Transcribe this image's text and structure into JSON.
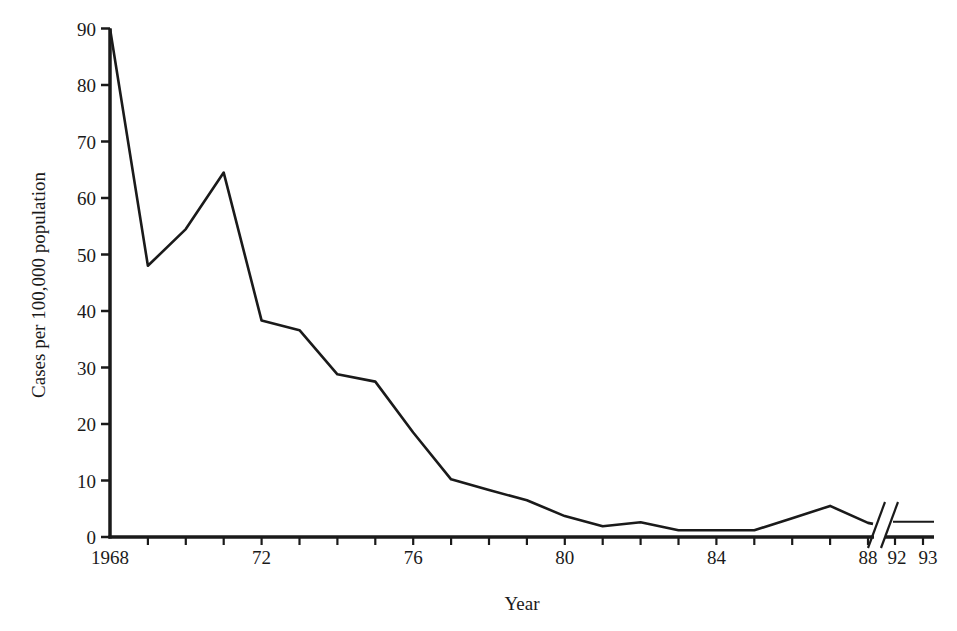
{
  "chart_data": {
    "type": "line",
    "title": "",
    "xlabel": "Year",
    "ylabel": "Cases per 100,000 population",
    "ylim": [
      0,
      90
    ],
    "yticks": [
      0,
      10,
      20,
      30,
      40,
      50,
      60,
      70,
      80,
      90
    ],
    "xtick_labels": [
      {
        "year": 1968,
        "label": "1968"
      },
      {
        "year": 1972,
        "label": "72"
      },
      {
        "year": 1976,
        "label": "76"
      },
      {
        "year": 1980,
        "label": "80"
      },
      {
        "year": 1984,
        "label": "84"
      },
      {
        "year": 1988,
        "label": "88"
      },
      {
        "year": 1992,
        "label": "92"
      },
      {
        "year": 1993,
        "label": "93"
      }
    ],
    "axis_break": {
      "between": [
        1988,
        1992
      ],
      "style": "double-slash"
    },
    "grid": false,
    "legend": null,
    "series": [
      {
        "name": "Incidence",
        "x": [
          1968,
          1969,
          1970,
          1971,
          1972,
          1973,
          1974,
          1975,
          1976,
          1977,
          1978,
          1979,
          1980,
          1981,
          1982,
          1983,
          1984,
          1985,
          1986,
          1987,
          1988,
          1992,
          1993
        ],
        "values": [
          90,
          48,
          54.5,
          64.5,
          38.3,
          36.6,
          28.8,
          27.5,
          18.5,
          10.2,
          8.3,
          6.5,
          3.7,
          1.9,
          2.6,
          1.2,
          1.2,
          1.2,
          3.3,
          5.5,
          2.5,
          2.7,
          2.7
        ]
      }
    ]
  },
  "caption": {
    "visible_text": ""
  }
}
